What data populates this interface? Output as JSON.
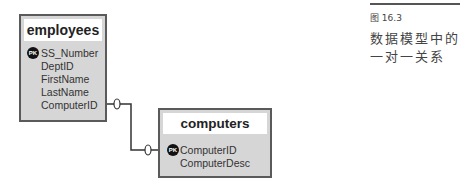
{
  "diagram": {
    "tables": [
      {
        "name": "employees",
        "fields": [
          {
            "name": "SS_Number",
            "pk": true
          },
          {
            "name": "DeptID",
            "pk": false
          },
          {
            "name": "FirstName",
            "pk": false
          },
          {
            "name": "LastName",
            "pk": false
          },
          {
            "name": "ComputerID",
            "pk": false
          }
        ]
      },
      {
        "name": "computers",
        "fields": [
          {
            "name": "ComputerID",
            "pk": true
          },
          {
            "name": "ComputerDesc",
            "pk": false
          }
        ]
      }
    ],
    "pk_label": "PK",
    "relationship": {
      "from": "employees.ComputerID",
      "to": "computers.ComputerID",
      "from_cardinality": "0",
      "to_cardinality": "0"
    }
  },
  "caption": {
    "figure": "图 16.3",
    "text": "数据模型中的一对一关系"
  }
}
